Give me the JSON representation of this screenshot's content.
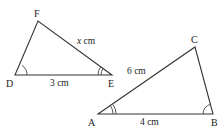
{
  "diagram": {
    "type": "similar-triangles",
    "stroke_color": "#333333",
    "triangles": [
      {
        "name": "DEF",
        "vertices": {
          "D": {
            "label": "D",
            "x": 15,
            "y": 75
          },
          "E": {
            "label": "E",
            "x": 112,
            "y": 75
          },
          "F": {
            "label": "F",
            "x": 38,
            "y": 21
          }
        },
        "sides": {
          "DE": {
            "label": "3 cm"
          },
          "EF": {
            "label_var": "x",
            "label_unit": " cm"
          }
        },
        "angle_marks": {
          "D": {
            "arcs": 1
          },
          "E": {
            "arcs": 2
          }
        }
      },
      {
        "name": "ABC",
        "vertices": {
          "A": {
            "label": "A",
            "x": 98,
            "y": 114
          },
          "B": {
            "label": "B",
            "x": 213,
            "y": 114
          },
          "C": {
            "label": "C",
            "x": 195,
            "y": 47
          }
        },
        "sides": {
          "AB": {
            "label": "4 cm"
          },
          "AC": {
            "label": "6 cm"
          }
        },
        "angle_marks": {
          "A": {
            "arcs": 2
          },
          "B": {
            "arcs": 1
          }
        }
      }
    ]
  }
}
